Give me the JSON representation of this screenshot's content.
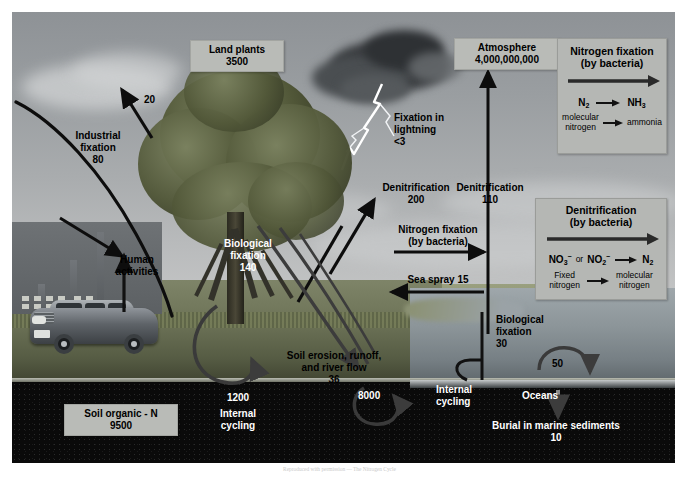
{
  "diagram": {
    "title": "The Nitrogen Cycle",
    "type": "biogeochemical-cycle"
  },
  "pools": [
    {
      "id": "land_plants",
      "label": "Land plants",
      "value": "3500"
    },
    {
      "id": "atmosphere",
      "label": "Atmosphere",
      "value": "4,000,000,000"
    },
    {
      "id": "soil_organic_n",
      "label": "Soil organic - N",
      "value": "9500"
    }
  ],
  "labels": {
    "industrial_fixation": {
      "name": "Industrial",
      "name2": "fixation",
      "value": "80"
    },
    "industrial_to_atm": {
      "value": "20"
    },
    "human_activities": {
      "line1": "Human",
      "line2": "activities"
    },
    "biological_fixation_land": {
      "line1": "Biological",
      "line2": "fixation",
      "value": "140"
    },
    "fixation_lightning": {
      "line1": "Fixation in",
      "line2": "lightning",
      "value": "<3"
    },
    "denitrification_land": {
      "name": "Denitrification",
      "value": "200"
    },
    "denitrification_ocean": {
      "name": "Denitrification",
      "value": "110"
    },
    "nitrogen_fixation_arrow": {
      "line1": "Nitrogen fixation",
      "line2": "(by bacteria)"
    },
    "sea_spray": {
      "text": "Sea spray 15"
    },
    "biological_fixation_ocean": {
      "line1": "Biological",
      "line2": "fixation",
      "value": "30"
    },
    "ocean_internal_cycling": {
      "value": "50",
      "line1": "Internal",
      "line2": "cycling"
    },
    "oceans": {
      "text": "Oceans"
    },
    "ocean_pool": {
      "value": "8000"
    },
    "soil_internal_cycling": {
      "value": "1200",
      "line1": "Internal",
      "line2": "cycling"
    },
    "soil_erosion": {
      "line1": "Soil erosion, runoff,",
      "line2": "and river flow",
      "value": "36"
    },
    "burial": {
      "text": "Burial in marine sediments",
      "value": "10"
    }
  },
  "panels": {
    "nitrogen_fixation": {
      "title_line1": "Nitrogen fixation",
      "title_line2": "(by bacteria)",
      "reactant_formula": "N",
      "reactant_sub": "2",
      "product_formula": "NH",
      "product_sub": "3",
      "reactant_name_line1": "molecular",
      "reactant_name_line2": "nitrogen",
      "product_name": "ammonia"
    },
    "denitrification": {
      "title_line1": "Denitrification",
      "title_line2": "(by bacteria)",
      "reactant_a": "NO",
      "reactant_a_sub": "3",
      "reactant_a_sup": "−",
      "conj": "or",
      "reactant_b": "NO",
      "reactant_b_sub": "2",
      "reactant_b_sup": "−",
      "product_formula": "N",
      "product_sub": "2",
      "reactant_name_line1": "Fixed",
      "reactant_name_line2": "nitrogen",
      "product_name_line1": "molecular",
      "product_name_line2": "nitrogen"
    }
  },
  "caption": {
    "text": "Reproduced with permission — The Nitrogen Cycle"
  },
  "colors": {
    "sky": "#9a9ea1",
    "panel_bg": "#b5b7b4",
    "label_bg": "#b9bbb7",
    "soil": "#0a0a0a",
    "water": "#8c9599",
    "arrow_dark": "#111111",
    "arrow_light": "#ffffff"
  }
}
